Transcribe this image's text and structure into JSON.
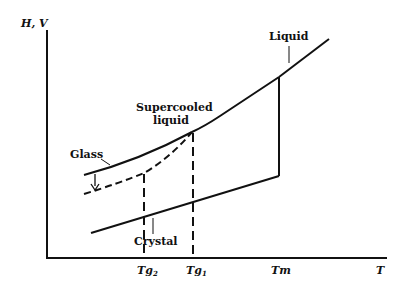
{
  "diagram": {
    "type": "phase-transition-diagram",
    "y_axis_label": "H, V",
    "x_axis_label": "T",
    "x_ticks": [
      {
        "label": "Tg",
        "subscript": "2"
      },
      {
        "label": "Tg",
        "subscript": "1"
      },
      {
        "label": "Tm",
        "subscript": ""
      }
    ],
    "labels": {
      "liquid": "Liquid",
      "supercooled_line1": "Supercooled",
      "supercooled_line2": "liquid",
      "glass": "Glass",
      "crystal": "Crystal"
    },
    "colors": {
      "line": "#111111",
      "background": "#ffffff"
    }
  }
}
